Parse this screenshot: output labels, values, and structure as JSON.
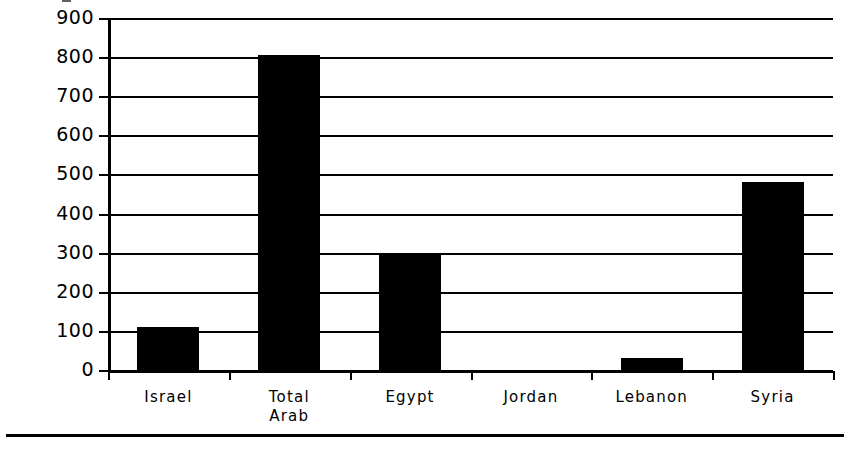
{
  "chart_data": {
    "type": "bar",
    "title": "",
    "xlabel": "",
    "ylabel": "",
    "categories": [
      "Israel",
      "Total Arab",
      "Egypt",
      "Jordan",
      "Lebanon",
      "Syria"
    ],
    "category_lines": [
      [
        "Israel"
      ],
      [
        "Total",
        "Arab"
      ],
      [
        "Egypt"
      ],
      [
        "Jordan"
      ],
      [
        "Lebanon"
      ],
      [
        "Syria"
      ]
    ],
    "values": [
      110,
      805,
      300,
      0,
      30,
      480
    ],
    "ylim": [
      0,
      900
    ],
    "ytick_values": [
      0,
      100,
      200,
      300,
      400,
      500,
      600,
      700,
      800,
      900
    ],
    "ytick_labels": [
      "0",
      "100",
      "200",
      "300",
      "400",
      "500",
      "600",
      "700",
      "800",
      "900"
    ],
    "grid": true,
    "legend": "none",
    "bar_color": "#000000",
    "axis_color": "#000000",
    "background_color": "#ffffff"
  }
}
